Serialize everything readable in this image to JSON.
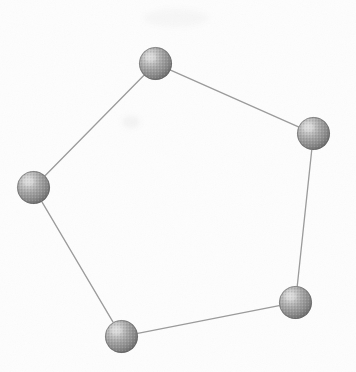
{
  "figure": {
    "width": 356,
    "height": 372,
    "background_color": "#fdfdfd",
    "ink_color": "#8a8a8a",
    "caption": ""
  },
  "style": {
    "node_radius": 16.5,
    "node_fill_light": "#c9c9c9",
    "node_fill_mid": "#9a9a9a",
    "node_fill_dark": "#6f6f6f",
    "node_rim_color": "#5e5e5e",
    "node_highlight_color": "#dedede",
    "edge_color": "#9b9b9b",
    "edge_width": 1.3,
    "halftone": "dithered-gray"
  },
  "graph_data": {
    "type": "diagram",
    "shape": "pentagon",
    "node_count": 5,
    "edge_count": 5,
    "nodes": [
      {
        "id": "n1",
        "label": "",
        "name": "node-top",
        "cx": 155.5,
        "cy": 63.5
      },
      {
        "id": "n2",
        "label": "",
        "name": "node-right",
        "cx": 313.5,
        "cy": 133.5
      },
      {
        "id": "n3",
        "label": "",
        "name": "node-bottom-right",
        "cx": 295.5,
        "cy": 302.5
      },
      {
        "id": "n4",
        "label": "",
        "name": "node-bottom-left",
        "cx": 121.5,
        "cy": 336.5
      },
      {
        "id": "n5",
        "label": "",
        "name": "node-left",
        "cx": 33.5,
        "cy": 187.5
      }
    ],
    "edges": [
      {
        "id": "e1",
        "name": "edge-top-right",
        "from": "n1",
        "to": "n2"
      },
      {
        "id": "e2",
        "name": "edge-right-bottomright",
        "from": "n2",
        "to": "n3"
      },
      {
        "id": "e3",
        "name": "edge-bottomright-bottomleft",
        "from": "n3",
        "to": "n4"
      },
      {
        "id": "e4",
        "name": "edge-bottomleft-left",
        "from": "n4",
        "to": "n5"
      },
      {
        "id": "e5",
        "name": "edge-left-top",
        "from": "n5",
        "to": "n1"
      }
    ]
  },
  "artifacts": [
    {
      "name": "scan-smudge-top",
      "cx": 176,
      "cy": 18,
      "rx": 32,
      "ry": 9,
      "opacity": 0.055
    },
    {
      "name": "scan-smudge-middle",
      "cx": 131,
      "cy": 122,
      "rx": 9,
      "ry": 6,
      "opacity": 0.085
    }
  ]
}
